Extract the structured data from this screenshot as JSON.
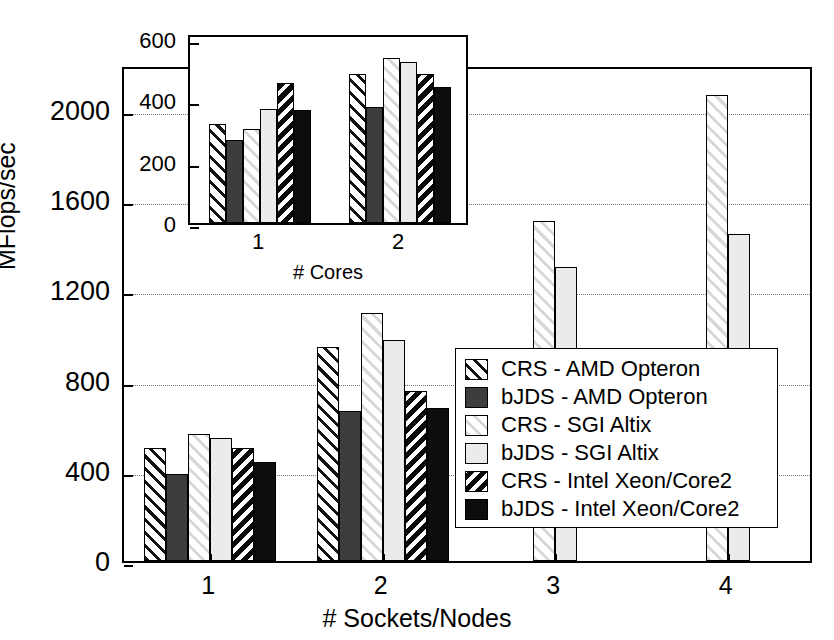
{
  "chart_data": {
    "type": "bar",
    "title": "",
    "xlabel": "# Sockets/Nodes",
    "ylabel": "MFlops/sec",
    "categories": [
      "1",
      "2",
      "3",
      "4"
    ],
    "ylim": [
      0,
      2200
    ],
    "yticks": [
      0,
      400,
      800,
      1200,
      1600,
      2000
    ],
    "ytick_labels": [
      "0",
      "400",
      "800",
      "1200",
      "1600",
      "2000"
    ],
    "grid": true,
    "legend_position": "center-right",
    "series": [
      {
        "name": "CRS - AMD Opteron",
        "pattern": "diagonal-hatch-dark",
        "values": [
          500,
          950,
          null,
          null
        ]
      },
      {
        "name": "bJDS - AMD Opteron",
        "pattern": "solid-dark-gray",
        "values": [
          385,
          665,
          null,
          null
        ]
      },
      {
        "name": "CRS - SGI Altix",
        "pattern": "diagonal-hatch-light",
        "values": [
          565,
          1100,
          1510,
          2065
        ]
      },
      {
        "name": "bJDS - SGI Altix",
        "pattern": "solid-light-gray",
        "values": [
          545,
          980,
          1305,
          1450
        ]
      },
      {
        "name": "CRS - Intel Xeon/Core2",
        "pattern": "black-white-stripes",
        "values": [
          500,
          755,
          null,
          null
        ]
      },
      {
        "name": "bJDS - Intel Xeon/Core2",
        "pattern": "solid-black",
        "values": [
          440,
          680,
          null,
          null
        ]
      }
    ]
  },
  "inset_chart_data": {
    "type": "bar",
    "title": "",
    "xlabel": "# Cores",
    "ylabel": "",
    "categories": [
      "1",
      "2"
    ],
    "ylim": [
      0,
      620
    ],
    "yticks": [
      0,
      200,
      400,
      600
    ],
    "ytick_labels": [
      "0",
      "200",
      "400",
      "600"
    ],
    "grid": false,
    "series": [
      {
        "name": "CRS - AMD Opteron",
        "pattern": "diagonal-hatch-dark",
        "values": [
          322,
          487
        ]
      },
      {
        "name": "bJDS - AMD Opteron",
        "pattern": "solid-dark-gray",
        "values": [
          272,
          380
        ]
      },
      {
        "name": "CRS - SGI Altix",
        "pattern": "diagonal-hatch-light",
        "values": [
          308,
          540
        ]
      },
      {
        "name": "bJDS - SGI Altix",
        "pattern": "solid-light-gray",
        "values": [
          372,
          525
        ]
      },
      {
        "name": "CRS - Intel Xeon/Core2",
        "pattern": "black-white-stripes",
        "values": [
          457,
          487
        ]
      },
      {
        "name": "bJDS - Intel Xeon/Core2",
        "pattern": "solid-black",
        "values": [
          368,
          443
        ]
      }
    ]
  },
  "legend": {
    "items": [
      {
        "label": "CRS - AMD Opteron",
        "swatch": "diagonal-hatch-dark"
      },
      {
        "label": "bJDS - AMD Opteron",
        "swatch": "solid-dark-gray"
      },
      {
        "label": "CRS - SGI Altix",
        "swatch": "diagonal-hatch-light"
      },
      {
        "label": "bJDS - SGI Altix",
        "swatch": "solid-light-gray"
      },
      {
        "label": "CRS - Intel Xeon/Core2",
        "swatch": "black-white-stripes"
      },
      {
        "label": "bJDS - Intel Xeon/Core2",
        "swatch": "solid-black"
      }
    ]
  },
  "colors": {
    "axis": "#000000",
    "grid": "#777777",
    "dark_gray": "#3d3d3d",
    "light_gray": "#ebebeb",
    "black": "#0d0d0d",
    "white": "#ffffff"
  }
}
